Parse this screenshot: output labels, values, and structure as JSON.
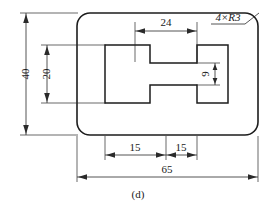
{
  "figure": {
    "caption": "(d)",
    "type": "engineering-drawing",
    "projection": "front-view",
    "background_color": "#ffffff",
    "line_color": "#1d1d1d"
  },
  "dimensions": {
    "overall_width": "65",
    "overall_height": "40",
    "slot_inner_height": "20",
    "center_bar_width": "24",
    "center_bar_height": "9",
    "left_segment": "15",
    "right_segment": "15",
    "corner_radius_note": "4×R3"
  },
  "labels": {
    "width_65": "65",
    "height_40": "40",
    "height_20": "20",
    "width_24": "24",
    "height_9": "9",
    "seg_left_15": "15",
    "seg_right_15": "15",
    "radius_note": "4×R3",
    "caption": "(d)"
  },
  "geometry": {
    "outer_plate": {
      "x": 77,
      "y": 13,
      "width": 181,
      "height": 122,
      "corner_radius": 13
    },
    "inner_h_shape": {
      "left_block": {
        "x": 105,
        "y": 45,
        "width": 45,
        "height": 58
      },
      "right_block": {
        "x": 185,
        "y": 45,
        "width": 43,
        "height": 58
      },
      "center_bar": {
        "x": 135,
        "y": 63,
        "width": 62,
        "height": 22
      }
    }
  }
}
